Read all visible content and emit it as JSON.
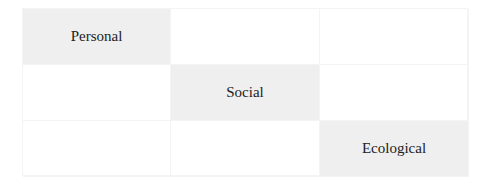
{
  "matrix": {
    "rows": [
      [
        "Personal",
        "",
        ""
      ],
      [
        "",
        "Social",
        ""
      ],
      [
        "",
        "",
        "Ecological"
      ]
    ],
    "highlight_color": "#efefef"
  }
}
